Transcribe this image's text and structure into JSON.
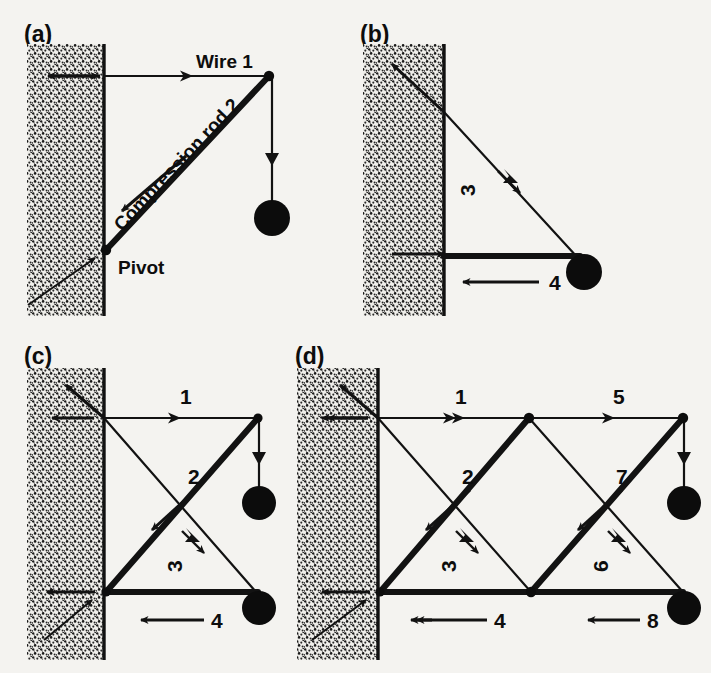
{
  "figure": {
    "background_color": "#f4f3f0",
    "ink_color": "#121212"
  },
  "panels": [
    {
      "id": "a",
      "label": "(a)",
      "description": "Single wire and compression rod supporting a hanging weight from a wall",
      "text_labels": [
        {
          "name": "wire-1-label",
          "text": "Wire 1"
        },
        {
          "name": "compression-rod-2-label",
          "text": "Compression rod 2"
        },
        {
          "name": "pivot-label",
          "text": "Pivot"
        }
      ],
      "members": [
        {
          "name": "wire-1",
          "number": "1",
          "type": "wire",
          "orientation": "horizontal",
          "arrow_direction": "right",
          "arrow_count": 1
        },
        {
          "name": "compression-rod-2",
          "number": "2",
          "type": "rod",
          "orientation": "diagonal-up-right",
          "arrow_direction": "down-left",
          "arrow_count": 1
        }
      ],
      "loads": [
        {
          "name": "hanging-weight",
          "shape": "ball",
          "arrow_direction": "down"
        }
      ]
    },
    {
      "id": "b",
      "label": "(b)",
      "description": "Inverted arrangement: diagonal wire 3 above, horizontal compression rod 4 below",
      "text_labels": [],
      "members": [
        {
          "name": "wire-3",
          "number": "3",
          "type": "wire",
          "orientation": "diagonal-down-right",
          "arrow_direction": "down-right",
          "arrow_count": 1
        },
        {
          "name": "compression-rod-4",
          "number": "4",
          "type": "rod",
          "orientation": "horizontal",
          "arrow_direction": "left",
          "arrow_count": 1
        }
      ],
      "loads": [
        {
          "name": "hanging-weight",
          "shape": "ball",
          "arrow_direction": "none"
        }
      ]
    },
    {
      "id": "c",
      "label": "(c)",
      "description": "Single-bay cross-braced truss with two weights",
      "text_labels": [],
      "members": [
        {
          "name": "wire-1",
          "number": "1",
          "type": "wire",
          "orientation": "horizontal-top",
          "arrow_direction": "right",
          "arrow_count": 1
        },
        {
          "name": "compression-rod-2",
          "number": "2",
          "type": "rod",
          "orientation": "diagonal-up-right",
          "arrow_direction": "down-left",
          "arrow_count": 1
        },
        {
          "name": "wire-3",
          "number": "3",
          "type": "wire",
          "orientation": "diagonal-down-right",
          "arrow_direction": "down-right",
          "arrow_count": 1
        },
        {
          "name": "compression-rod-4",
          "number": "4",
          "type": "rod",
          "orientation": "horizontal-bottom",
          "arrow_direction": "left",
          "arrow_count": 1
        }
      ],
      "loads": [
        {
          "name": "hanging-weight-top",
          "shape": "ball",
          "arrow_direction": "down"
        },
        {
          "name": "hanging-weight-bottom",
          "shape": "ball",
          "arrow_direction": "none"
        }
      ]
    },
    {
      "id": "d",
      "label": "(d)",
      "description": "Two-bay cross-braced truss with eight numbered members and two weights",
      "text_labels": [],
      "members": [
        {
          "name": "wire-1",
          "number": "1",
          "type": "wire",
          "orientation": "horizontal-top-left",
          "arrow_direction": "right",
          "arrow_count": 2
        },
        {
          "name": "compression-rod-2",
          "number": "2",
          "type": "rod",
          "orientation": "diagonal-up-right",
          "arrow_direction": "down-left",
          "arrow_count": 1
        },
        {
          "name": "wire-3",
          "number": "3",
          "type": "wire",
          "orientation": "diagonal-down-right",
          "arrow_direction": "down-right",
          "arrow_count": 1
        },
        {
          "name": "compression-rod-4",
          "number": "4",
          "type": "rod",
          "orientation": "horizontal-bottom-left",
          "arrow_direction": "left",
          "arrow_count": 2
        },
        {
          "name": "wire-5",
          "number": "5",
          "type": "wire",
          "orientation": "horizontal-top-right",
          "arrow_direction": "right",
          "arrow_count": 1
        },
        {
          "name": "wire-6",
          "number": "6",
          "type": "wire",
          "orientation": "diagonal-down-right",
          "arrow_direction": "down-right",
          "arrow_count": 1
        },
        {
          "name": "compression-rod-7",
          "number": "7",
          "type": "rod",
          "orientation": "diagonal-up-right",
          "arrow_direction": "down-left",
          "arrow_count": 1
        },
        {
          "name": "compression-rod-8",
          "number": "8",
          "type": "rod",
          "orientation": "horizontal-bottom-right",
          "arrow_direction": "left",
          "arrow_count": 1
        }
      ],
      "loads": [
        {
          "name": "hanging-weight-top",
          "shape": "ball",
          "arrow_direction": "down"
        },
        {
          "name": "hanging-weight-bottom",
          "shape": "ball",
          "arrow_direction": "none"
        }
      ]
    }
  ]
}
